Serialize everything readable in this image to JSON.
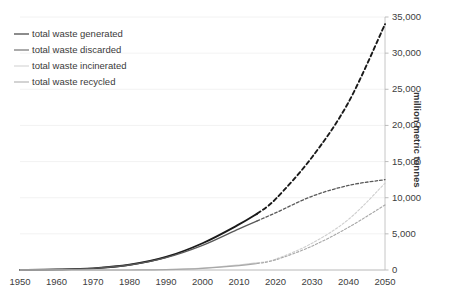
{
  "chart_data": {
    "type": "line",
    "title": "",
    "subtitle": "",
    "xlabel": "",
    "ylabel": "million metric tonnes",
    "xlim": [
      1950,
      2050
    ],
    "ylim": [
      0,
      35000
    ],
    "grid": true,
    "legend_position": "top-left",
    "y_axis_side": "right",
    "x_ticks": [
      "1950",
      "1960",
      "1970",
      "1980",
      "1990",
      "2000",
      "2010",
      "2020",
      "2030",
      "2040",
      "2050"
    ],
    "y_ticks": [
      "0",
      "5,000",
      "10,000",
      "15,000",
      "20,000",
      "25,000",
      "30,000",
      "35,000"
    ],
    "historical_end_year": 2015,
    "x": [
      1950,
      1960,
      1970,
      1980,
      1990,
      2000,
      2010,
      2015,
      2020,
      2030,
      2040,
      2050
    ],
    "series": [
      {
        "name": "total waste generated",
        "color": "#1a1a1a",
        "width": 1.9,
        "values": [
          2,
          60,
          230,
          720,
          1800,
          3700,
          6300,
          7800,
          9800,
          15600,
          23200,
          34000
        ]
      },
      {
        "name": "total waste discarded",
        "color": "#595959",
        "width": 1.3,
        "values": [
          2,
          58,
          222,
          690,
          1700,
          3400,
          5700,
          6800,
          7900,
          10200,
          11700,
          12500
        ]
      },
      {
        "name": "total waste incinerated",
        "color": "#cfcfcf",
        "width": 1.1,
        "values": [
          0,
          0,
          2,
          10,
          60,
          260,
          700,
          1000,
          1500,
          3700,
          7000,
          12000
        ]
      },
      {
        "name": "total waste recycled",
        "color": "#a8a8a8",
        "width": 1.1,
        "values": [
          0,
          0,
          1,
          8,
          50,
          230,
          600,
          900,
          1400,
          3300,
          5900,
          9000
        ]
      }
    ]
  },
  "legend": {
    "items": [
      {
        "label": "total waste generated"
      },
      {
        "label": "total waste discarded"
      },
      {
        "label": "total waste incinerated"
      },
      {
        "label": "total waste recycled"
      }
    ]
  },
  "axes": {
    "y_title": "million metric tonnes"
  }
}
